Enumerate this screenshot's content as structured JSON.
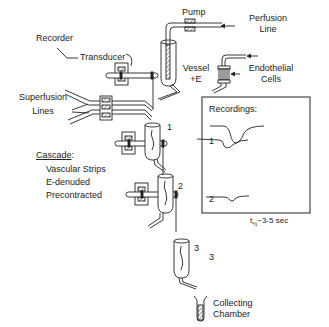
{
  "diagram": {
    "type": "bioassay-cascade-apparatus",
    "labels": {
      "recorder": "Recorder",
      "transducer": "Transducer",
      "pump": "Pump",
      "perfusion_line_1": "Perfusion",
      "perfusion_line_2": "Line",
      "vessel_1": "Vessel",
      "vessel_2": "+E",
      "endothelial_1": "Endothelial",
      "endothelial_2": "Cells",
      "superfusion_1": "Superfusion",
      "superfusion_2": "Lines",
      "cascade_title": "Cascade",
      "cascade_colon": ":",
      "cascade_items": [
        "Vascular Strips",
        "E-denuded",
        "Precontracted"
      ],
      "collecting_1": "Collecting",
      "collecting_2": "Chamber"
    },
    "stages": [
      {
        "number": "1"
      },
      {
        "number": "2"
      },
      {
        "number": "3"
      }
    ],
    "recordings": {
      "title": "Recordings:",
      "traces": [
        {
          "label": "1",
          "relative_depth": 1.0
        },
        {
          "label": "2",
          "relative_depth": 0.65
        },
        {
          "label": "3",
          "relative_depth": 0.25
        }
      ],
      "half_life_t": "t",
      "half_life_sub": "½",
      "half_life_value": "~3-5 sec"
    }
  }
}
